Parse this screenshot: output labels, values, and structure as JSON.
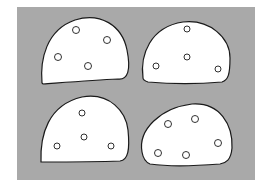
{
  "figure": {
    "background_color": "#ffffff",
    "panel_color": "#a9a9a9",
    "shape_fill": "#ffffff",
    "stroke_color": "#1a1a1a",
    "panel": {
      "x": 17,
      "y": 7,
      "w": 238,
      "h": 173
    },
    "shapes": [
      {
        "name": "top-left-dome",
        "path": "M42,83 C40,60 46,30 75,20 C100,12 122,25 127,50 C131,70 128,80 118,79 C95,80 70,82 43,84 Z",
        "circles": [
          {
            "cx": 76,
            "cy": 30,
            "r": 3.5
          },
          {
            "cx": 107,
            "cy": 40,
            "r": 3.5
          },
          {
            "cx": 58,
            "cy": 57,
            "r": 3.5
          },
          {
            "cx": 88,
            "cy": 66,
            "r": 3.5
          }
        ]
      },
      {
        "name": "top-right-dome",
        "path": "M143,78 C140,55 150,27 183,22 C210,19 230,38 230,58 C230,75 228,80 222,82 C200,84 170,84 148,82 C145,81 143,80 143,78 Z",
        "circles": [
          {
            "cx": 187,
            "cy": 29,
            "r": 3
          },
          {
            "cx": 187,
            "cy": 57,
            "r": 3
          },
          {
            "cx": 156,
            "cy": 66,
            "r": 3
          },
          {
            "cx": 218,
            "cy": 69,
            "r": 3
          }
        ]
      },
      {
        "name": "bottom-left-dome",
        "path": "M41,162 C40,135 48,105 82,97 C110,92 126,112 128,130 C130,150 128,160 120,161 C95,162 65,162 41,162 Z",
        "circles": [
          {
            "cx": 82,
            "cy": 113,
            "r": 3
          },
          {
            "cx": 84,
            "cy": 137,
            "r": 3
          },
          {
            "cx": 57,
            "cy": 146,
            "r": 3
          },
          {
            "cx": 111,
            "cy": 146,
            "r": 3
          }
        ]
      },
      {
        "name": "bottom-right-dome",
        "path": "M142,152 C138,130 160,108 192,104 C220,102 233,125 232,148 C231,160 226,163 220,164 C195,166 170,167 150,164 C145,162 143,158 142,152 Z",
        "circles": [
          {
            "cx": 168,
            "cy": 124,
            "r": 3.5
          },
          {
            "cx": 195,
            "cy": 119,
            "r": 3.5
          },
          {
            "cx": 218,
            "cy": 143,
            "r": 3.5
          },
          {
            "cx": 158,
            "cy": 153,
            "r": 3.5
          },
          {
            "cx": 186,
            "cy": 155,
            "r": 3.5
          }
        ]
      }
    ]
  }
}
